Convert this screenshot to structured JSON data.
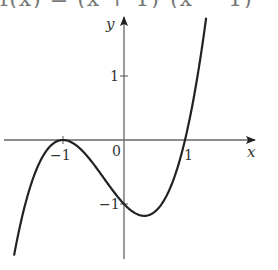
{
  "chart_data": {
    "type": "line",
    "xlabel": "x",
    "ylabel": "y",
    "x_ticks": [
      -1,
      0,
      1
    ],
    "y_ticks": [
      -1,
      1
    ],
    "xlim": [
      -2.0,
      2.1
    ],
    "ylim": [
      -1.9,
      1.9
    ],
    "grid": false,
    "series": [
      {
        "name": "f(x)",
        "x": [
          -1.8,
          -1.6,
          -1.4,
          -1.2,
          -1.0,
          -0.8,
          -0.6,
          -0.4,
          -0.2,
          0.0,
          0.2,
          0.333,
          0.4,
          0.6,
          0.8,
          1.0,
          1.2,
          1.4,
          1.5
        ],
        "values": [
          -1.792,
          -0.936,
          -0.384,
          -0.088,
          0.0,
          -0.072,
          -0.256,
          -0.504,
          -0.768,
          -1.0,
          -1.152,
          -1.185,
          -1.176,
          -1.024,
          -0.648,
          0.0,
          0.968,
          2.304,
          3.125
        ]
      }
    ],
    "annotations": {
      "local_max": {
        "x": -1,
        "y": 0
      },
      "local_min": {
        "x": 0.333,
        "y": -1.185
      },
      "y_intercept": {
        "x": 0,
        "y": -1
      },
      "x_intercepts": [
        -1,
        1
      ]
    }
  },
  "labels": {
    "formula_clipped": "f(x) = (x + 1)²(x − 1)",
    "x_axis": "x",
    "y_axis": "y",
    "origin": "0",
    "x_tick_neg1": "−1",
    "x_tick_1": "1",
    "y_tick_1": "1",
    "y_tick_neg1": "−1"
  },
  "colors": {
    "curve": "#222222",
    "axes": "#555555",
    "text": "#333333"
  }
}
